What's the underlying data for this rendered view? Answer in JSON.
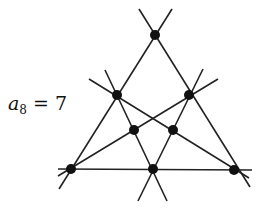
{
  "label": {
    "symbol": "a",
    "subscript": "8",
    "equals": "=",
    "value": "7"
  },
  "diagram": {
    "points": [
      {
        "id": "top",
        "x": 155,
        "y": 35
      },
      {
        "id": "left-mid",
        "x": 117,
        "y": 95
      },
      {
        "id": "right-mid",
        "x": 189,
        "y": 95
      },
      {
        "id": "inner-left",
        "x": 134,
        "y": 130
      },
      {
        "id": "inner-right",
        "x": 173,
        "y": 130
      },
      {
        "id": "bottom-left",
        "x": 71,
        "y": 169
      },
      {
        "id": "bottom-mid",
        "x": 153,
        "y": 169
      },
      {
        "id": "bottom-right",
        "x": 234,
        "y": 170
      }
    ],
    "line_count": 6,
    "point_count": 8,
    "stroke_color": "#222222"
  }
}
